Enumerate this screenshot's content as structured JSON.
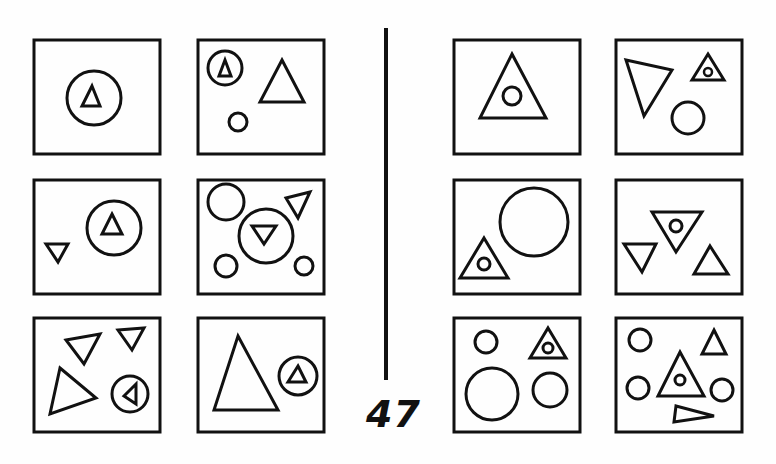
{
  "figure": {
    "number_label": "47",
    "stroke_color": "#111111",
    "background": "#fefefe"
  },
  "left_group": {
    "panels": [
      {
        "id": "L1",
        "row": 1,
        "col": 1,
        "shapes": [
          "circle containing small upright triangle"
        ]
      },
      {
        "id": "L2",
        "row": 1,
        "col": 2,
        "shapes": [
          "small circle containing tiny triangle",
          "large upright triangle",
          "small circle"
        ]
      },
      {
        "id": "L3",
        "row": 2,
        "col": 1,
        "shapes": [
          "circle containing upright triangle",
          "small inverted triangle"
        ]
      },
      {
        "id": "L4",
        "row": 2,
        "col": 2,
        "shapes": [
          "circle",
          "inverted triangle",
          "circle containing inverted triangle",
          "small circle",
          "small circle"
        ]
      },
      {
        "id": "L5",
        "row": 3,
        "col": 1,
        "shapes": [
          "inverted triangle",
          "small inverted triangle",
          "tilted triangle",
          "circle containing left-pointing triangle"
        ]
      },
      {
        "id": "L6",
        "row": 3,
        "col": 2,
        "shapes": [
          "large upright triangle",
          "circle containing small triangle"
        ]
      }
    ]
  },
  "right_group": {
    "panels": [
      {
        "id": "R1",
        "row": 1,
        "col": 1,
        "shapes": [
          "upright triangle containing small circle"
        ]
      },
      {
        "id": "R2",
        "row": 1,
        "col": 2,
        "shapes": [
          "tilted inverted triangle",
          "small triangle containing tiny circle",
          "circle"
        ]
      },
      {
        "id": "R3",
        "row": 2,
        "col": 1,
        "shapes": [
          "large circle",
          "triangle containing small circle"
        ]
      },
      {
        "id": "R4",
        "row": 2,
        "col": 2,
        "shapes": [
          "inverted triangle containing small circle",
          "small inverted triangle",
          "small upright triangle"
        ]
      },
      {
        "id": "R5",
        "row": 3,
        "col": 1,
        "shapes": [
          "small circle",
          "triangle containing small circle",
          "large circle",
          "circle"
        ]
      },
      {
        "id": "R6",
        "row": 3,
        "col": 2,
        "shapes": [
          "small circle",
          "small triangle",
          "circle",
          "triangle containing small circle",
          "circle",
          "flat triangle"
        ]
      }
    ]
  }
}
